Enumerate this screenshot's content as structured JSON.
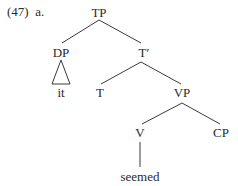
{
  "example": {
    "number": "(47)",
    "sublabel": "a.",
    "full_label": "(47)  a."
  },
  "tree": {
    "nodes": {
      "TP": "TP",
      "DP": "DP",
      "it": "it",
      "T_bar": "T′",
      "T": "T",
      "VP": "VP",
      "V": "V",
      "CP": "CP",
      "seemed": "seemed"
    },
    "edges": [
      [
        "TP",
        "DP"
      ],
      [
        "TP",
        "T_bar"
      ],
      [
        "DP",
        "it (triangle)"
      ],
      [
        "T_bar",
        "T"
      ],
      [
        "T_bar",
        "VP"
      ],
      [
        "VP",
        "V"
      ],
      [
        "VP",
        "CP"
      ],
      [
        "V",
        "seemed"
      ]
    ]
  }
}
